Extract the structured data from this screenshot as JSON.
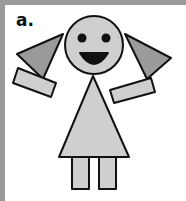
{
  "figure": {
    "label": "a.",
    "colors": {
      "body_fill": "#cfcfcf",
      "hair_fill": "#9a9a9a",
      "outline": "#111111",
      "border": "#9a9a9a"
    }
  }
}
